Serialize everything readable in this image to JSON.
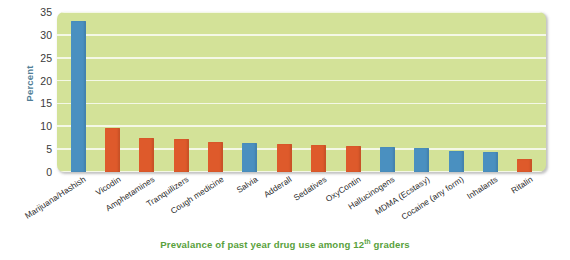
{
  "chart_data": {
    "type": "bar",
    "title": "",
    "caption": "Prevalance of past year drug use among 12th graders",
    "caption_prefix": "Prevalance of past year drug use among 12",
    "caption_superscript": "th",
    "caption_suffix": " graders",
    "xlabel": "",
    "ylabel": "Percent",
    "ylim": [
      0,
      35
    ],
    "yticks": [
      0,
      5,
      10,
      15,
      20,
      25,
      30,
      35
    ],
    "ytick_labels": [
      "0",
      "5",
      "10",
      "15",
      "20",
      "25",
      "30",
      "35"
    ],
    "grid": true,
    "legend": "none",
    "categories": [
      "Marijuana/Hashish",
      "Vicodin",
      "Amphetamines",
      "Tranquilizers",
      "Cough medicine",
      "Salvia",
      "Adderall",
      "Sedatives",
      "OxyContin",
      "Hallucinogens",
      "MDMA (Ecstasy)",
      "Cocaine (any form)",
      "Inhalants",
      "Ritalin"
    ],
    "values": [
      33.0,
      9.7,
      7.5,
      7.3,
      6.6,
      6.3,
      6.1,
      6.0,
      5.8,
      5.5,
      5.3,
      4.5,
      4.4,
      2.8
    ],
    "bar_colors": [
      "blue",
      "orange",
      "orange",
      "orange",
      "orange",
      "blue",
      "orange",
      "orange",
      "orange",
      "blue",
      "blue",
      "blue",
      "blue",
      "orange"
    ],
    "colors": {
      "blue": "#4a90c0",
      "orange": "#de5a2b",
      "plot_background": "#d3e298",
      "gridline": "#f4f8e6",
      "axis_title": "#4f7d96",
      "caption": "#59a13c"
    }
  }
}
